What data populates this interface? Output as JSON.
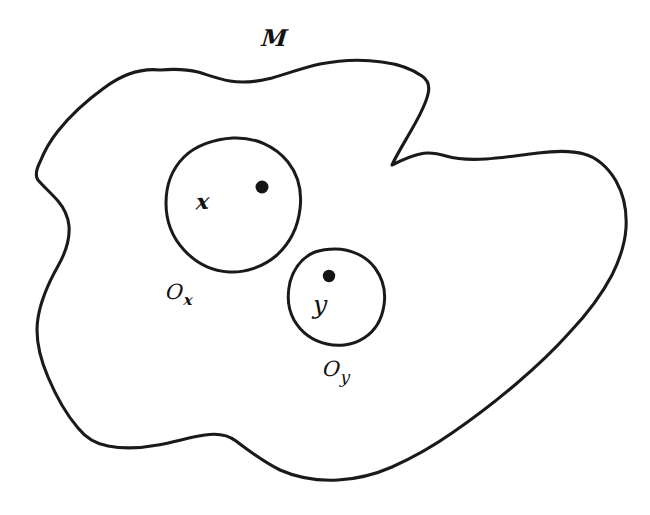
{
  "figure": {
    "kind": "hand-drawn-topology-diagram",
    "background_color": "#ffffff",
    "ink_color": "#1a1a1a",
    "width": 650,
    "height": 515,
    "space_label": "M",
    "labels": {
      "space": "M",
      "point_x": "x",
      "point_y": "y",
      "open_set_x_base": "O",
      "open_set_x_sub": "x",
      "open_set_y_base": "O",
      "open_set_y_sub": "y"
    },
    "regions": [
      {
        "name": "ambient-space",
        "label": "M",
        "shape": "irregular-blob",
        "label_position": {
          "x": 265,
          "y": 28
        }
      },
      {
        "name": "neighbourhood-of-x",
        "label": "O",
        "subscript": "x",
        "shape": "circle",
        "center": {
          "x": 233,
          "y": 205
        },
        "radius": 67,
        "label_position": {
          "x": 166,
          "y": 284
        }
      },
      {
        "name": "neighbourhood-of-y",
        "label": "O",
        "subscript": "y",
        "shape": "circle",
        "center": {
          "x": 335,
          "y": 296
        },
        "radius": 47,
        "label_position": {
          "x": 323,
          "y": 361
        }
      }
    ],
    "points": [
      {
        "name": "point-x",
        "label": "x",
        "dot": {
          "x": 262,
          "y": 187,
          "r": 6.5
        },
        "label_position": {
          "x": 195,
          "y": 190
        }
      },
      {
        "name": "point-y",
        "label": "y",
        "dot": {
          "x": 329,
          "y": 276,
          "r": 6.2
        },
        "label_position": {
          "x": 313,
          "y": 293
        }
      }
    ]
  }
}
